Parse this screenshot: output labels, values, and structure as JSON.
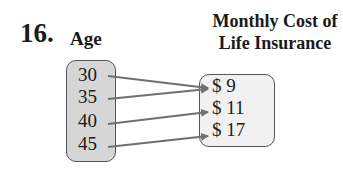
{
  "problem": {
    "number": "16."
  },
  "domain": {
    "title": "Age",
    "values": [
      "30",
      "35",
      "40",
      "45"
    ]
  },
  "range": {
    "title_line1": "Monthly Cost of",
    "title_line2": "Life Insurance",
    "values": [
      "$ 9",
      "$ 11",
      "$ 17"
    ]
  },
  "mapping": [
    {
      "from": "30",
      "to": "$ 9"
    },
    {
      "from": "35",
      "to": "$ 9"
    },
    {
      "from": "40",
      "to": "$ 11"
    },
    {
      "from": "45",
      "to": "$ 17"
    }
  ],
  "colors": {
    "domain_fill": "#d6d6d6",
    "range_fill": "#f1f1f1",
    "arrow": "#707070",
    "border": "#555555"
  }
}
